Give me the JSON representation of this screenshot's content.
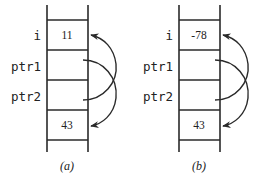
{
  "diagrams": [
    {
      "caption": "(a)",
      "labels": {
        "i": "i",
        "ptr1": "ptr1",
        "ptr2": "ptr2"
      },
      "cells": {
        "i": "11",
        "ptr1": "",
        "ptr2": "",
        "bottom": "43"
      },
      "arrows": [
        {
          "from": "ptr1",
          "to": "bottom"
        },
        {
          "from": "ptr2",
          "to": "i"
        }
      ]
    },
    {
      "caption": "(b)",
      "labels": {
        "i": "i",
        "ptr1": "ptr1",
        "ptr2": "ptr2"
      },
      "cells": {
        "i": "-78",
        "ptr1": "",
        "ptr2": "",
        "bottom": "43"
      },
      "arrows": [
        {
          "from": "ptr1",
          "to": "bottom"
        },
        {
          "from": "ptr2",
          "to": "i"
        }
      ]
    }
  ]
}
